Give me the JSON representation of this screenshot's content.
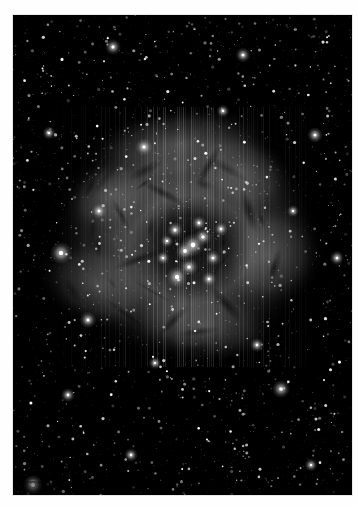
{
  "page": {
    "background_color": "#fefefe",
    "margin_text": "· · · · · ·",
    "margin_text_note": "faint illegible vertical scan text at left edge"
  },
  "plate": {
    "name": "rosette-nebula-photograph",
    "kind": "astronomical-photograph",
    "rendering": "grayscale / monochrome",
    "frame": {
      "x": 13,
      "y": 15,
      "width": 339,
      "height": 480
    },
    "background_color": "#000000",
    "highlight_color": "#ffffff",
    "nebula_color": "#8e8e8e",
    "dust_color": "#1a1a1a",
    "subject": {
      "nebula": "Rosette Nebula",
      "cluster": "NGC 2244",
      "description": "Large circular emission nebula with a dark central cavity, a bright open star cluster at the core, radial dust lanes and a dense surrounding star field."
    },
    "scan_artifact": "faint vertical striping across the nebula"
  },
  "image_content": {
    "type": "scatter",
    "title": "Rosette Nebula",
    "background": "#000000",
    "field": {
      "width": 339,
      "height": 480
    },
    "nebula_glow": {
      "center_x": 172,
      "center_y": 222,
      "radius_x": 136,
      "radius_y": 130,
      "peak_brightness": 0.55,
      "inner_cavity_radius": 52
    },
    "cavity": {
      "center_x": 178,
      "center_y": 232,
      "radius_x": 60,
      "radius_y": 52,
      "darkness": 0.85
    },
    "dust_lanes": [
      {
        "x": 196,
        "y": 150,
        "length": 44,
        "angle": 118,
        "width": 5,
        "opacity": 0.8
      },
      {
        "x": 150,
        "y": 178,
        "length": 52,
        "angle": 28,
        "width": 5,
        "opacity": 0.7
      },
      {
        "x": 236,
        "y": 196,
        "length": 46,
        "angle": 72,
        "width": 6,
        "opacity": 0.75
      },
      {
        "x": 126,
        "y": 244,
        "length": 58,
        "angle": 160,
        "width": 5,
        "opacity": 0.7
      },
      {
        "x": 214,
        "y": 290,
        "length": 50,
        "angle": 48,
        "width": 6,
        "opacity": 0.7
      },
      {
        "x": 160,
        "y": 306,
        "length": 44,
        "angle": 134,
        "width": 5,
        "opacity": 0.65
      },
      {
        "x": 262,
        "y": 252,
        "length": 40,
        "angle": 104,
        "width": 5,
        "opacity": 0.6
      },
      {
        "x": 108,
        "y": 200,
        "length": 36,
        "angle": 62,
        "width": 4,
        "opacity": 0.6
      }
    ],
    "bright_stars": [
      {
        "x": 180,
        "y": 230,
        "r": 4.6
      },
      {
        "x": 172,
        "y": 236,
        "r": 3.8
      },
      {
        "x": 190,
        "y": 222,
        "r": 3.4
      },
      {
        "x": 162,
        "y": 215,
        "r": 3.2
      },
      {
        "x": 200,
        "y": 243,
        "r": 3.0
      },
      {
        "x": 176,
        "y": 252,
        "r": 3.6
      },
      {
        "x": 164,
        "y": 262,
        "r": 4.2
      },
      {
        "x": 186,
        "y": 208,
        "r": 2.8
      },
      {
        "x": 150,
        "y": 243,
        "r": 2.6
      },
      {
        "x": 208,
        "y": 214,
        "r": 2.7
      },
      {
        "x": 196,
        "y": 264,
        "r": 2.9
      },
      {
        "x": 154,
        "y": 226,
        "r": 2.5
      },
      {
        "x": 131,
        "y": 132,
        "r": 3.4
      },
      {
        "x": 48,
        "y": 238,
        "r": 4.4
      },
      {
        "x": 20,
        "y": 470,
        "r": 4.0
      },
      {
        "x": 268,
        "y": 374,
        "r": 3.6
      },
      {
        "x": 75,
        "y": 305,
        "r": 3.3
      },
      {
        "x": 100,
        "y": 32,
        "r": 3.2
      },
      {
        "x": 302,
        "y": 120,
        "r": 3.1
      },
      {
        "x": 230,
        "y": 40,
        "r": 3.0
      },
      {
        "x": 86,
        "y": 196,
        "r": 3.0
      },
      {
        "x": 324,
        "y": 243,
        "r": 2.9
      },
      {
        "x": 55,
        "y": 380,
        "r": 2.8
      },
      {
        "x": 244,
        "y": 330,
        "r": 2.8
      },
      {
        "x": 118,
        "y": 440,
        "r": 2.7
      },
      {
        "x": 298,
        "y": 450,
        "r": 2.6
      },
      {
        "x": 36,
        "y": 118,
        "r": 2.6
      },
      {
        "x": 210,
        "y": 96,
        "r": 2.5
      },
      {
        "x": 142,
        "y": 348,
        "r": 2.5
      },
      {
        "x": 280,
        "y": 196,
        "r": 2.4
      }
    ],
    "star_count_estimate": 2400
  }
}
